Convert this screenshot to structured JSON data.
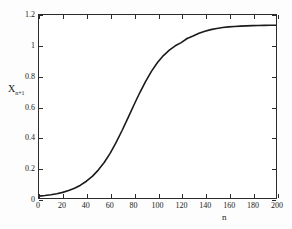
{
  "chart_data": {
    "type": "line",
    "title": "",
    "subtitle": "",
    "xlabel": "n",
    "ylabel_main": "X",
    "ylabel_sub": "n+1",
    "ylabel": "X_n+1",
    "xlim": [
      0,
      200
    ],
    "ylim": [
      0,
      1.2
    ],
    "grid": false,
    "legend": null,
    "xticks": [
      0,
      20,
      40,
      60,
      80,
      100,
      120,
      140,
      160,
      180,
      200
    ],
    "xticklabels": [
      "0",
      "20",
      "40",
      "60",
      "80",
      "100",
      "120",
      "140",
      "160",
      "180",
      "200"
    ],
    "yticks": [
      0,
      0.2,
      0.4,
      0.6,
      0.8,
      1,
      1.2
    ],
    "yticklabels": [
      "0",
      "0.2",
      "0.4",
      "0.6",
      "0.8",
      "1",
      "1.2"
    ],
    "series": [
      {
        "name": "X_n+1",
        "color": "#1a1a1a",
        "linewidth": 1.6,
        "x": [
          0,
          5,
          10,
          15,
          20,
          25,
          30,
          35,
          40,
          45,
          50,
          55,
          60,
          65,
          70,
          75,
          80,
          85,
          90,
          95,
          100,
          105,
          110,
          115,
          120,
          125,
          130,
          135,
          140,
          145,
          150,
          155,
          160,
          165,
          170,
          175,
          180,
          185,
          190,
          195,
          200
        ],
        "values": [
          0.012,
          0.016,
          0.021,
          0.028,
          0.037,
          0.049,
          0.064,
          0.084,
          0.11,
          0.142,
          0.183,
          0.233,
          0.293,
          0.363,
          0.441,
          0.524,
          0.608,
          0.69,
          0.765,
          0.832,
          0.888,
          0.934,
          0.97,
          0.998,
          1.019,
          1.046,
          1.062,
          1.08,
          1.094,
          1.104,
          1.112,
          1.118,
          1.122,
          1.125,
          1.127,
          1.129,
          1.13,
          1.131,
          1.132,
          1.133,
          1.133
        ]
      }
    ],
    "annotations": []
  },
  "figure": {
    "background_color": "#fdfdfd",
    "plot_background_color": "#ffffff",
    "axis_color": "#2b2b2b",
    "curve_color": "#1a1a1a"
  }
}
